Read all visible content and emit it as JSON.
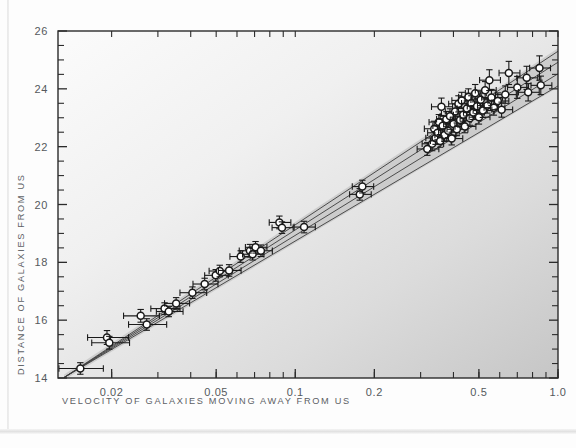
{
  "chart_data": {
    "type": "scatter",
    "title": "",
    "xlabel": "VELOCITY OF GALAXIES MOVING AWAY FROM US",
    "ylabel": "DISTANCE OF GALAXIES FROM US",
    "xscale": "log",
    "yscale": "linear",
    "xlim": [
      0.0125,
      1.0
    ],
    "ylim": [
      14,
      26
    ],
    "grid": false,
    "legend": null,
    "xticks": [
      0.02,
      0.05,
      0.1,
      0.2,
      0.5,
      1.0
    ],
    "xtick_labels": [
      "0.02",
      "0.05",
      "0.1",
      "0.2",
      "0.5",
      "1.0"
    ],
    "yticks": [
      14,
      16,
      18,
      20,
      22,
      24,
      26
    ],
    "ytick_labels": [
      "14",
      "16",
      "18",
      "20",
      "22",
      "24",
      "26"
    ],
    "y_minor_tick_step": 0.5,
    "marker": "open-circle",
    "marker_face_color": "#ffffff",
    "marker_edge_color": "#1a1a1a",
    "errorbar_color": "#1a1a1a",
    "has_x_errorbars": true,
    "has_y_errorbars": true,
    "fit_lines": [
      {
        "name": "fit-line-1",
        "color": "#3c3c3c",
        "x0": 0.0132,
        "y0": 14.02,
        "x1": 1.0,
        "y1": 24.1
      },
      {
        "name": "fit-line-2",
        "color": "#3c3c3c",
        "x0": 0.0132,
        "y0": 14.02,
        "x1": 1.0,
        "y1": 24.52
      },
      {
        "name": "fit-line-3",
        "color": "#3c3c3c",
        "x0": 0.0132,
        "y0": 14.02,
        "x1": 1.0,
        "y1": 24.92
      },
      {
        "name": "fit-line-4",
        "color": "#3c3c3c",
        "x0": 0.0132,
        "y0": 14.02,
        "x1": 1.0,
        "y1": 25.3
      }
    ],
    "confidence_band": {
      "color": "#b8b8b8",
      "x0": 0.0132,
      "y0_lo": 13.94,
      "y0_hi": 14.12,
      "x1": 1.0,
      "y1_lo": 24.05,
      "y1_hi": 25.4
    },
    "points": [
      {
        "x": 0.0152,
        "y": 14.33,
        "xerr_lo": 0.0026,
        "xerr_hi": 0.0034,
        "yerr": 0.2
      },
      {
        "x": 0.0192,
        "y": 15.4,
        "xerr_lo": 0.003,
        "xerr_hi": 0.004,
        "yerr": 0.24
      },
      {
        "x": 0.0196,
        "y": 15.22,
        "xerr_lo": 0.0028,
        "xerr_hi": 0.0038,
        "yerr": 0.22
      },
      {
        "x": 0.0258,
        "y": 16.15,
        "xerr_lo": 0.0036,
        "xerr_hi": 0.0046,
        "yerr": 0.22
      },
      {
        "x": 0.0272,
        "y": 15.85,
        "xerr_lo": 0.004,
        "xerr_hi": 0.0052,
        "yerr": 0.2
      },
      {
        "x": 0.0318,
        "y": 16.4,
        "xerr_lo": 0.0036,
        "xerr_hi": 0.0046,
        "yerr": 0.2
      },
      {
        "x": 0.033,
        "y": 16.3,
        "xerr_lo": 0.0034,
        "xerr_hi": 0.0044,
        "yerr": 0.18
      },
      {
        "x": 0.0352,
        "y": 16.58,
        "xerr_lo": 0.0034,
        "xerr_hi": 0.0044,
        "yerr": 0.2
      },
      {
        "x": 0.0406,
        "y": 16.95,
        "xerr_lo": 0.0042,
        "xerr_hi": 0.0054,
        "yerr": 0.2
      },
      {
        "x": 0.0452,
        "y": 17.25,
        "xerr_lo": 0.0044,
        "xerr_hi": 0.0056,
        "yerr": 0.2
      },
      {
        "x": 0.0498,
        "y": 17.55,
        "xerr_lo": 0.0046,
        "xerr_hi": 0.0058,
        "yerr": 0.2
      },
      {
        "x": 0.0516,
        "y": 17.7,
        "xerr_lo": 0.0046,
        "xerr_hi": 0.0058,
        "yerr": 0.2
      },
      {
        "x": 0.056,
        "y": 17.72,
        "xerr_lo": 0.005,
        "xerr_hi": 0.0062,
        "yerr": 0.2
      },
      {
        "x": 0.062,
        "y": 18.2,
        "xerr_lo": 0.0056,
        "xerr_hi": 0.0068,
        "yerr": 0.2
      },
      {
        "x": 0.0672,
        "y": 18.4,
        "xerr_lo": 0.006,
        "xerr_hi": 0.0074,
        "yerr": 0.22
      },
      {
        "x": 0.0688,
        "y": 18.28,
        "xerr_lo": 0.0058,
        "xerr_hi": 0.0072,
        "yerr": 0.2
      },
      {
        "x": 0.0706,
        "y": 18.52,
        "xerr_lo": 0.006,
        "xerr_hi": 0.0074,
        "yerr": 0.2
      },
      {
        "x": 0.074,
        "y": 18.4,
        "xerr_lo": 0.0062,
        "xerr_hi": 0.0078,
        "yerr": 0.2
      },
      {
        "x": 0.087,
        "y": 19.38,
        "xerr_lo": 0.0074,
        "xerr_hi": 0.0092,
        "yerr": 0.22
      },
      {
        "x": 0.089,
        "y": 19.2,
        "xerr_lo": 0.0074,
        "xerr_hi": 0.0092,
        "yerr": 0.2
      },
      {
        "x": 0.108,
        "y": 19.22,
        "xerr_lo": 0.009,
        "xerr_hi": 0.0112,
        "yerr": 0.2
      },
      {
        "x": 0.176,
        "y": 20.35,
        "xerr_lo": 0.015,
        "xerr_hi": 0.0186,
        "yerr": 0.2
      },
      {
        "x": 0.18,
        "y": 20.62,
        "xerr_lo": 0.0152,
        "xerr_hi": 0.0188,
        "yerr": 0.22
      },
      {
        "x": 0.318,
        "y": 21.92,
        "xerr_lo": 0.027,
        "xerr_hi": 0.034,
        "yerr": 0.22
      },
      {
        "x": 0.332,
        "y": 22.1,
        "xerr_lo": 0.028,
        "xerr_hi": 0.035,
        "yerr": 0.24
      },
      {
        "x": 0.338,
        "y": 22.62,
        "xerr_lo": 0.028,
        "xerr_hi": 0.035,
        "yerr": 0.26
      },
      {
        "x": 0.342,
        "y": 22.3,
        "xerr_lo": 0.028,
        "xerr_hi": 0.035,
        "yerr": 0.22
      },
      {
        "x": 0.348,
        "y": 22.48,
        "xerr_lo": 0.029,
        "xerr_hi": 0.036,
        "yerr": 0.24
      },
      {
        "x": 0.352,
        "y": 22.85,
        "xerr_lo": 0.029,
        "xerr_hi": 0.036,
        "yerr": 0.26
      },
      {
        "x": 0.356,
        "y": 22.2,
        "xerr_lo": 0.029,
        "xerr_hi": 0.036,
        "yerr": 0.22
      },
      {
        "x": 0.36,
        "y": 23.38,
        "xerr_lo": 0.03,
        "xerr_hi": 0.037,
        "yerr": 0.3
      },
      {
        "x": 0.364,
        "y": 22.72,
        "xerr_lo": 0.03,
        "xerr_hi": 0.037,
        "yerr": 0.24
      },
      {
        "x": 0.37,
        "y": 22.4,
        "xerr_lo": 0.03,
        "xerr_hi": 0.038,
        "yerr": 0.22
      },
      {
        "x": 0.376,
        "y": 22.95,
        "xerr_lo": 0.031,
        "xerr_hi": 0.0385,
        "yerr": 0.26
      },
      {
        "x": 0.382,
        "y": 22.55,
        "xerr_lo": 0.031,
        "xerr_hi": 0.039,
        "yerr": 0.24
      },
      {
        "x": 0.388,
        "y": 23.05,
        "xerr_lo": 0.032,
        "xerr_hi": 0.0395,
        "yerr": 0.26
      },
      {
        "x": 0.394,
        "y": 22.28,
        "xerr_lo": 0.032,
        "xerr_hi": 0.04,
        "yerr": 0.22
      },
      {
        "x": 0.4,
        "y": 22.78,
        "xerr_lo": 0.033,
        "xerr_hi": 0.041,
        "yerr": 0.24
      },
      {
        "x": 0.406,
        "y": 23.22,
        "xerr_lo": 0.0335,
        "xerr_hi": 0.0415,
        "yerr": 0.26
      },
      {
        "x": 0.412,
        "y": 22.6,
        "xerr_lo": 0.034,
        "xerr_hi": 0.042,
        "yerr": 0.22
      },
      {
        "x": 0.418,
        "y": 23.48,
        "xerr_lo": 0.0345,
        "xerr_hi": 0.0425,
        "yerr": 0.28
      },
      {
        "x": 0.424,
        "y": 22.92,
        "xerr_lo": 0.035,
        "xerr_hi": 0.043,
        "yerr": 0.24
      },
      {
        "x": 0.43,
        "y": 23.6,
        "xerr_lo": 0.0355,
        "xerr_hi": 0.044,
        "yerr": 0.28
      },
      {
        "x": 0.436,
        "y": 23.1,
        "xerr_lo": 0.036,
        "xerr_hi": 0.0445,
        "yerr": 0.24
      },
      {
        "x": 0.442,
        "y": 22.7,
        "xerr_lo": 0.0365,
        "xerr_hi": 0.045,
        "yerr": 0.22
      },
      {
        "x": 0.45,
        "y": 23.32,
        "xerr_lo": 0.037,
        "xerr_hi": 0.046,
        "yerr": 0.26
      },
      {
        "x": 0.456,
        "y": 23.72,
        "xerr_lo": 0.0375,
        "xerr_hi": 0.0465,
        "yerr": 0.28
      },
      {
        "x": 0.462,
        "y": 22.98,
        "xerr_lo": 0.038,
        "xerr_hi": 0.047,
        "yerr": 0.24
      },
      {
        "x": 0.468,
        "y": 23.5,
        "xerr_lo": 0.0385,
        "xerr_hi": 0.0478,
        "yerr": 0.26
      },
      {
        "x": 0.476,
        "y": 23.18,
        "xerr_lo": 0.0392,
        "xerr_hi": 0.0485,
        "yerr": 0.24
      },
      {
        "x": 0.484,
        "y": 23.85,
        "xerr_lo": 0.04,
        "xerr_hi": 0.0495,
        "yerr": 0.3
      },
      {
        "x": 0.492,
        "y": 23.4,
        "xerr_lo": 0.0405,
        "xerr_hi": 0.05,
        "yerr": 0.26
      },
      {
        "x": 0.5,
        "y": 23.02,
        "xerr_lo": 0.0412,
        "xerr_hi": 0.051,
        "yerr": 0.24
      },
      {
        "x": 0.508,
        "y": 23.62,
        "xerr_lo": 0.0418,
        "xerr_hi": 0.0518,
        "yerr": 0.28
      },
      {
        "x": 0.518,
        "y": 23.25,
        "xerr_lo": 0.0426,
        "xerr_hi": 0.0528,
        "yerr": 0.24
      },
      {
        "x": 0.528,
        "y": 23.95,
        "xerr_lo": 0.0434,
        "xerr_hi": 0.0538,
        "yerr": 0.3
      },
      {
        "x": 0.538,
        "y": 23.42,
        "xerr_lo": 0.0442,
        "xerr_hi": 0.0548,
        "yerr": 0.26
      },
      {
        "x": 0.548,
        "y": 24.3,
        "xerr_lo": 0.045,
        "xerr_hi": 0.0558,
        "yerr": 0.36
      },
      {
        "x": 0.558,
        "y": 23.7,
        "xerr_lo": 0.0458,
        "xerr_hi": 0.0568,
        "yerr": 0.28
      },
      {
        "x": 0.57,
        "y": 23.35,
        "xerr_lo": 0.0468,
        "xerr_hi": 0.058,
        "yerr": 0.26
      },
      {
        "x": 0.59,
        "y": 23.58,
        "xerr_lo": 0.0485,
        "xerr_hi": 0.06,
        "yerr": 0.28
      },
      {
        "x": 0.61,
        "y": 23.28,
        "xerr_lo": 0.05,
        "xerr_hi": 0.062,
        "yerr": 0.26
      },
      {
        "x": 0.63,
        "y": 23.8,
        "xerr_lo": 0.0518,
        "xerr_hi": 0.064,
        "yerr": 0.3
      },
      {
        "x": 0.65,
        "y": 24.55,
        "xerr_lo": 0.0535,
        "xerr_hi": 0.0662,
        "yerr": 0.4
      },
      {
        "x": 0.7,
        "y": 24.05,
        "xerr_lo": 0.0575,
        "xerr_hi": 0.0712,
        "yerr": 0.38
      },
      {
        "x": 0.76,
        "y": 24.38,
        "xerr_lo": 0.0625,
        "xerr_hi": 0.0775,
        "yerr": 0.4
      },
      {
        "x": 0.77,
        "y": 23.88,
        "xerr_lo": 0.0632,
        "xerr_hi": 0.0785,
        "yerr": 0.3
      },
      {
        "x": 0.85,
        "y": 24.72,
        "xerr_lo": 0.07,
        "xerr_hi": 0.0865,
        "yerr": 0.42
      },
      {
        "x": 0.86,
        "y": 24.12,
        "xerr_lo": 0.0708,
        "xerr_hi": 0.0875,
        "yerr": 0.32
      }
    ]
  },
  "figure": {
    "background_color": "#fdfdfd",
    "plot_area_color_top_left": "#fafafa",
    "plot_area_color_bottom_right": "#c9c9c9",
    "frame_color": "#2b2b2b"
  }
}
